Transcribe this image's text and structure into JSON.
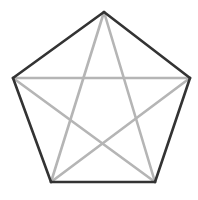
{
  "figure": {
    "background_color": "#ffffff",
    "width": 198,
    "height": 200
  },
  "geometry": {
    "vertex_labels": [
      "top",
      "right",
      "bottom-right",
      "bottom-left",
      "left"
    ],
    "vertices": [
      {
        "label": "top",
        "x": 104,
        "y": 12
      },
      {
        "label": "right",
        "x": 190,
        "y": 78
      },
      {
        "label": "bottom-right",
        "x": 155,
        "y": 182
      },
      {
        "label": "bottom-left",
        "x": 51,
        "y": 182
      },
      {
        "label": "left",
        "x": 13,
        "y": 78
      }
    ]
  },
  "pentagon": {
    "name": "outer-pentagon",
    "stroke_color": "#333333",
    "stroke_width": 2.6,
    "fill": "none",
    "edges": [
      {
        "name": "edge-top-left",
        "from": "left",
        "to": "top",
        "x1": 13,
        "y1": 78,
        "x2": 104,
        "y2": 12
      },
      {
        "name": "edge-top-right",
        "from": "top",
        "to": "right",
        "x1": 104,
        "y1": 12,
        "x2": 190,
        "y2": 78
      },
      {
        "name": "edge-right",
        "from": "right",
        "to": "bottom-right",
        "x1": 190,
        "y1": 78,
        "x2": 155,
        "y2": 182
      },
      {
        "name": "edge-bottom",
        "from": "bottom-right",
        "to": "bottom-left",
        "x1": 155,
        "y1": 182,
        "x2": 51,
        "y2": 182
      },
      {
        "name": "edge-left",
        "from": "bottom-left",
        "to": "left",
        "x1": 51,
        "y1": 182,
        "x2": 13,
        "y2": 78
      }
    ]
  },
  "pentagram": {
    "name": "inscribed-star",
    "stroke_color": "#b5b5b5",
    "stroke_width": 2.6,
    "fill": "none",
    "chords": [
      {
        "name": "chord-top-to-bottom-left",
        "from": "top",
        "to": "bottom-left",
        "x1": 104,
        "y1": 12,
        "x2": 51,
        "y2": 182
      },
      {
        "name": "chord-bottom-left-to-right",
        "from": "bottom-left",
        "to": "right",
        "x1": 51,
        "y1": 182,
        "x2": 190,
        "y2": 78
      },
      {
        "name": "chord-right-to-left",
        "from": "right",
        "to": "left",
        "x1": 190,
        "y1": 78,
        "x2": 13,
        "y2": 78
      },
      {
        "name": "chord-left-to-bottom-right",
        "from": "left",
        "to": "bottom-right",
        "x1": 13,
        "y1": 78,
        "x2": 155,
        "y2": 182
      },
      {
        "name": "chord-bottom-right-to-top",
        "from": "bottom-right",
        "to": "top",
        "x1": 155,
        "y1": 182,
        "x2": 104,
        "y2": 12
      }
    ]
  }
}
